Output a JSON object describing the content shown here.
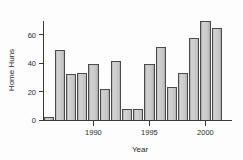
{
  "chart_data": {
    "type": "bar",
    "title": "",
    "xlabel": "Year",
    "ylabel": "Home Huns",
    "categories": [
      1986,
      1987,
      1988,
      1989,
      1990,
      1991,
      1992,
      1993,
      1994,
      1995,
      1996,
      1997,
      1998,
      1999,
      2000,
      2001
    ],
    "values": [
      2,
      49,
      32,
      33,
      39,
      22,
      41,
      8,
      8,
      39,
      51,
      23,
      33,
      57,
      69,
      64
    ],
    "series": [
      {
        "name": "Home Huns",
        "values": [
          2,
          49,
          32,
          33,
          39,
          22,
          41,
          8,
          8,
          39,
          51,
          23,
          33,
          57,
          69,
          64
        ]
      }
    ],
    "xlim": [
      1985.5,
      2001.5
    ],
    "ylim": [
      0,
      70
    ],
    "yticks": [
      0,
      20,
      40,
      60
    ],
    "ytick_labels": [
      "0",
      "20",
      "40",
      "60"
    ],
    "xticks": [
      1990,
      1995,
      2000
    ],
    "xtick_labels": [
      "1990",
      "1995",
      "2000"
    ],
    "grid": false,
    "legend": false,
    "bar_fill_color": "#c9c9c9",
    "bar_edge_color": "#4a4a4a",
    "axis_color": "#3a3a3a",
    "background_color": "#fdfdfd"
  },
  "axes": {
    "y_label": "Home Huns",
    "x_label": "Year",
    "y_tick_labels": [
      "60",
      "40",
      "20",
      "0"
    ],
    "x_tick_labels": [
      "1990",
      "1995",
      "2000"
    ]
  }
}
